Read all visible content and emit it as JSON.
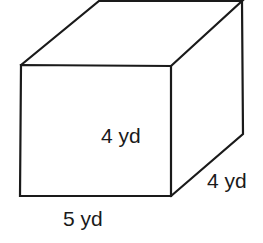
{
  "diagram": {
    "type": "rectangular-prism",
    "colors": {
      "stroke": "#1a1a1a",
      "background": "#ffffff"
    },
    "labels": {
      "height": "4 yd",
      "depth": "4 yd",
      "length": "5 yd"
    }
  }
}
